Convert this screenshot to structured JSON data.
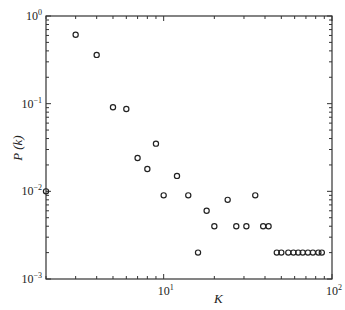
{
  "chart_data": {
    "type": "scatter",
    "title": "",
    "xlabel": "K",
    "ylabel": "P (k)",
    "xscale": "log",
    "yscale": "log",
    "xlim": [
      2,
      100
    ],
    "ylim": [
      0.001,
      1
    ],
    "grid": false,
    "legend": null,
    "x_ticks": [
      {
        "base": "10",
        "exp": "1",
        "value": 10
      },
      {
        "base": "10",
        "exp": "2",
        "value": 100
      }
    ],
    "y_ticks": [
      {
        "base": "10",
        "exp": "0",
        "value": 1
      },
      {
        "base": "10",
        "exp": "-1",
        "value": 0.1
      },
      {
        "base": "10",
        "exp": "-2",
        "value": 0.01
      },
      {
        "base": "10",
        "exp": "-3",
        "value": 0.001
      }
    ],
    "marker": "open-circle",
    "series": [
      {
        "name": "P(k)",
        "points": [
          {
            "x": 2,
            "y": 0.01
          },
          {
            "x": 3,
            "y": 0.61
          },
          {
            "x": 4,
            "y": 0.36
          },
          {
            "x": 5,
            "y": 0.091
          },
          {
            "x": 6,
            "y": 0.087
          },
          {
            "x": 7,
            "y": 0.024
          },
          {
            "x": 8,
            "y": 0.018
          },
          {
            "x": 9,
            "y": 0.035
          },
          {
            "x": 10,
            "y": 0.009
          },
          {
            "x": 12,
            "y": 0.015
          },
          {
            "x": 14,
            "y": 0.009
          },
          {
            "x": 16,
            "y": 0.002
          },
          {
            "x": 18,
            "y": 0.006
          },
          {
            "x": 20,
            "y": 0.004
          },
          {
            "x": 24,
            "y": 0.008
          },
          {
            "x": 27,
            "y": 0.004
          },
          {
            "x": 31,
            "y": 0.004
          },
          {
            "x": 35,
            "y": 0.009
          },
          {
            "x": 39,
            "y": 0.004
          },
          {
            "x": 42,
            "y": 0.004
          },
          {
            "x": 47,
            "y": 0.002
          },
          {
            "x": 50,
            "y": 0.002
          },
          {
            "x": 55,
            "y": 0.002
          },
          {
            "x": 59,
            "y": 0.002
          },
          {
            "x": 63,
            "y": 0.002
          },
          {
            "x": 67,
            "y": 0.002
          },
          {
            "x": 72,
            "y": 0.002
          },
          {
            "x": 77,
            "y": 0.002
          },
          {
            "x": 83,
            "y": 0.002
          },
          {
            "x": 87,
            "y": 0.002
          }
        ]
      }
    ]
  },
  "colors": {
    "axis": "#333333",
    "marker": "#222222",
    "background": "#ffffff"
  }
}
